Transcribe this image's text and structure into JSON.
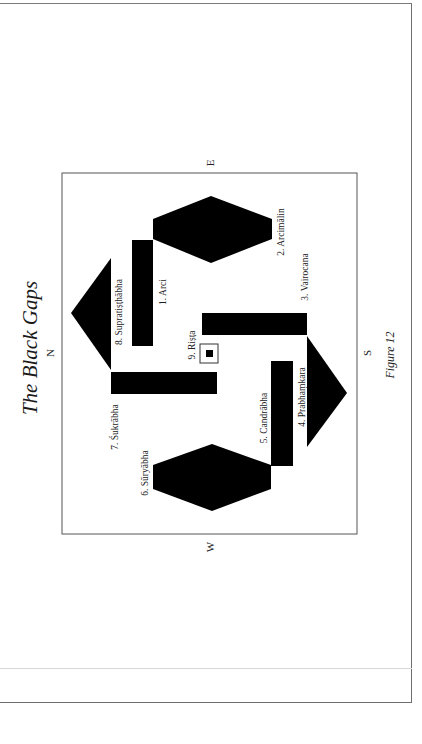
{
  "page": {
    "title": "The Black Gaps",
    "caption": "Figure 12",
    "orientation": "rotated 90° counter-clockwise"
  },
  "compass": {
    "north": "N",
    "east": "E",
    "south": "S",
    "west": "W"
  },
  "colors": {
    "shape_fill": "#000000",
    "frame_stroke": "#555555",
    "page_border": "#6e6e6e",
    "background": "#ffffff"
  },
  "gaps": [
    {
      "id": 1,
      "label": "1. Arci",
      "shape": "rectangle"
    },
    {
      "id": 2,
      "label": "2. Arcimālin",
      "shape": "hexagon"
    },
    {
      "id": 3,
      "label": "3. Vairocana",
      "shape": "rectangle"
    },
    {
      "id": 4,
      "label": "4. Prabhaṃkara",
      "shape": "triangle"
    },
    {
      "id": 5,
      "label": "5. Candrābha",
      "shape": "rectangle"
    },
    {
      "id": 6,
      "label": "6. Sūryābha",
      "shape": "hexagon"
    },
    {
      "id": 7,
      "label": "7. Śukrābha",
      "shape": "rectangle"
    },
    {
      "id": 8,
      "label": "8. Supratiṣṭhābha",
      "shape": "triangle"
    },
    {
      "id": 9,
      "label": "9. Riṣṭa",
      "shape": "square"
    }
  ]
}
